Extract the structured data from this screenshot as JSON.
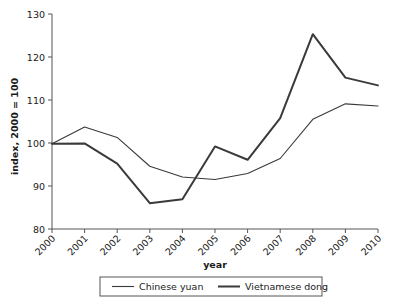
{
  "chart_data": {
    "type": "line",
    "title": "",
    "xlabel": "year",
    "ylabel": "index, 2000 = 100",
    "x": [
      2000,
      2001,
      2002,
      2003,
      2004,
      2005,
      2006,
      2007,
      2008,
      2009,
      2010
    ],
    "categories": [
      "2000",
      "2001",
      "2002",
      "2003",
      "2004",
      "2005",
      "2006",
      "2007",
      "2008",
      "2009",
      "2010"
    ],
    "xtick_labels": [
      "2000",
      "2001",
      "2002",
      "2003",
      "2004",
      "2005",
      "2006",
      "2007",
      "2008",
      "2009",
      "2010"
    ],
    "ytick_labels": [
      "80",
      "90",
      "100",
      "110",
      "120",
      "130"
    ],
    "yticks": [
      80,
      90,
      100,
      110,
      120,
      130
    ],
    "ylim": [
      80,
      130
    ],
    "xlim": [
      2000,
      2010
    ],
    "grid": false,
    "legend_position": "bottom",
    "series": [
      {
        "name": "Chinese yuan",
        "color": "#3a3a3a",
        "width": 1.1,
        "values": [
          99.8,
          103.7,
          101.3,
          94.6,
          92.1,
          91.5,
          92.9,
          96.4,
          105.5,
          109.1,
          108.6
        ]
      },
      {
        "name": "Vietnamese dong",
        "color": "#3a3a3a",
        "width": 2.0,
        "values": [
          99.8,
          99.9,
          95.2,
          86.0,
          86.9,
          99.2,
          96.1,
          105.8,
          125.3,
          115.2,
          113.4
        ]
      }
    ]
  },
  "legend": {
    "entries": [
      {
        "label": "Chinese yuan"
      },
      {
        "label": "Vietnamese dong"
      }
    ]
  },
  "axes": {
    "x_title": "year",
    "y_title": "index, 2000 = 100"
  }
}
